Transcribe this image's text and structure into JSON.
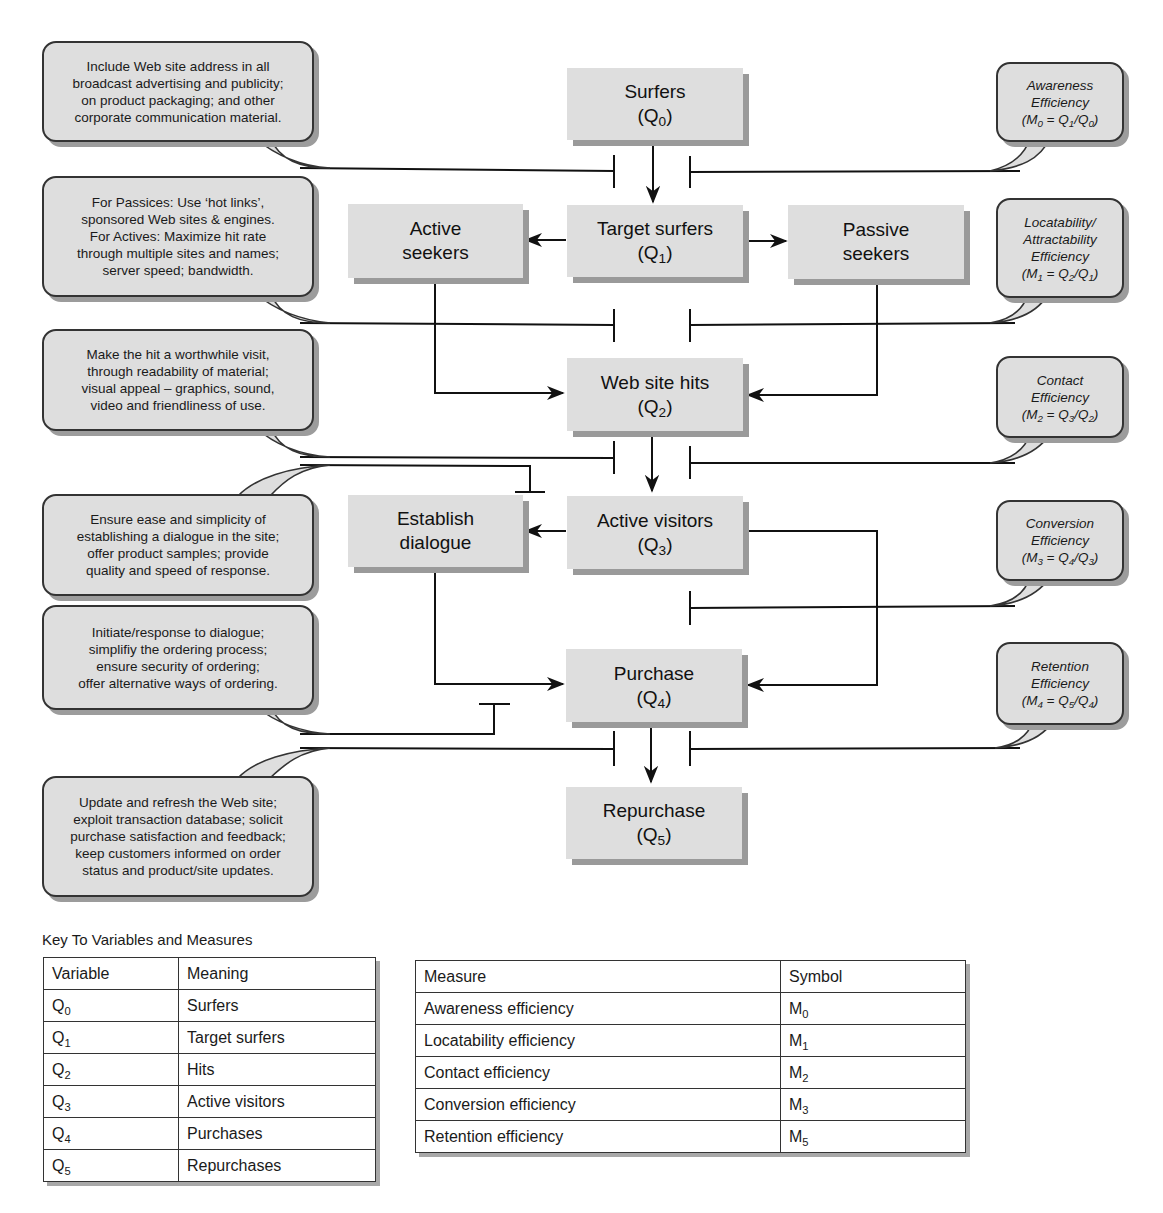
{
  "nodes": {
    "surfers": {
      "label": "Surfers",
      "var": "Q",
      "sub": "0"
    },
    "target_surfers": {
      "label": "Target surfers",
      "var": "Q",
      "sub": "1"
    },
    "active_seekers": {
      "label": "Active",
      "label2": "seekers"
    },
    "passive_seekers": {
      "label": "Passive",
      "label2": "seekers"
    },
    "web_site_hits": {
      "label": "Web site hits",
      "var": "Q",
      "sub": "2"
    },
    "active_visitors": {
      "label": "Active visitors",
      "var": "Q",
      "sub": "3"
    },
    "establish_dialogue": {
      "label": "Establish",
      "label2": "dialogue"
    },
    "purchase": {
      "label": "Purchase",
      "var": "Q",
      "sub": "4"
    },
    "repurchase": {
      "label": "Repurchase",
      "var": "Q",
      "sub": "5"
    }
  },
  "left_callouts": [
    {
      "lines": [
        "Include Web site address in all",
        "broadcast advertising and publicity;",
        "on product packaging; and other",
        "corporate communication material."
      ]
    },
    {
      "lines": [
        "For Passices: Use ‘hot links’,",
        "sponsored Web sites & engines.",
        "For Actives: Maximize hit rate",
        "through multiple sites and names;",
        "server speed; bandwidth."
      ]
    },
    {
      "lines": [
        "Make the hit a worthwhile visit,",
        "through readability of material;",
        "visual appeal – graphics, sound,",
        "video and friendliness of use."
      ]
    },
    {
      "lines": [
        "Ensure ease and simplicity of",
        "establishing a dialogue in the site;",
        "offer product samples; provide",
        "quality and speed of response."
      ]
    },
    {
      "lines": [
        "Initiate/response to dialogue;",
        "simplifiy the ordering process;",
        "ensure security of ordering;",
        "offer alternative ways of ordering."
      ]
    },
    {
      "lines": [
        "Update and refresh the Web site;",
        "exploit transaction database; solicit",
        "purchase satisfaction and feedback;",
        "keep customers informed on order",
        "status and product/site updates."
      ]
    }
  ],
  "right_callouts": [
    {
      "lines": [
        "Awareness",
        "Efficiency"
      ],
      "formula": {
        "m": "0",
        "num": "1",
        "den": "0"
      }
    },
    {
      "lines": [
        "Locatability/",
        "Attractability",
        "Efficiency"
      ],
      "formula": {
        "m": "1",
        "num": "2",
        "den": "1"
      }
    },
    {
      "lines": [
        "Contact",
        "Efficiency"
      ],
      "formula": {
        "m": "2",
        "num": "3",
        "den": "2"
      }
    },
    {
      "lines": [
        "Conversion",
        "Efficiency"
      ],
      "formula": {
        "m": "3",
        "num": "4",
        "den": "3"
      }
    },
    {
      "lines": [
        "Retention",
        "Efficiency"
      ],
      "formula": {
        "m": "4",
        "num": "5",
        "den": "4"
      }
    }
  ],
  "key": {
    "title": "Key To Variables and Measures",
    "variables": {
      "headers": [
        "Variable",
        "Meaning"
      ],
      "rows": [
        {
          "var": "Q",
          "sub": "0",
          "meaning": "Surfers"
        },
        {
          "var": "Q",
          "sub": "1",
          "meaning": "Target surfers"
        },
        {
          "var": "Q",
          "sub": "2",
          "meaning": "Hits"
        },
        {
          "var": "Q",
          "sub": "3",
          "meaning": "Active visitors"
        },
        {
          "var": "Q",
          "sub": "4",
          "meaning": "Purchases"
        },
        {
          "var": "Q",
          "sub": "5",
          "meaning": "Repurchases"
        }
      ]
    },
    "measures": {
      "headers": [
        "Measure",
        "Symbol"
      ],
      "rows": [
        {
          "measure": "Awareness efficiency",
          "sym": "M",
          "sub": "0"
        },
        {
          "measure": "Locatability efficiency",
          "sym": "M",
          "sub": "1"
        },
        {
          "measure": "Contact efficiency",
          "sym": "M",
          "sub": "2"
        },
        {
          "measure": "Conversion efficiency",
          "sym": "M",
          "sub": "3"
        },
        {
          "measure": "Retention efficiency",
          "sym": "M",
          "sub": "5"
        }
      ]
    }
  },
  "colors": {
    "box_fill": "#dedede",
    "box_shadow": "#9a9a9a",
    "line": "#111111"
  }
}
